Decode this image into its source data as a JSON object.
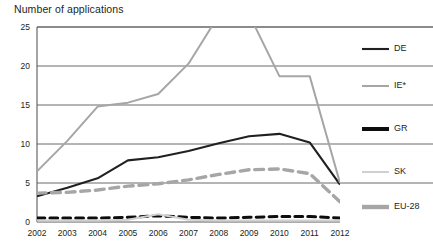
{
  "chart_data": {
    "type": "line",
    "title": "Number of applications",
    "xlabel": "",
    "ylabel": "",
    "categories": [
      "2002",
      "2003",
      "2004",
      "2005",
      "2006",
      "2007",
      "2008",
      "2009",
      "2010",
      "2011",
      "2012"
    ],
    "ylim": [
      0,
      25
    ],
    "xlim": [
      "2002",
      "2012"
    ],
    "yticks": [
      "0",
      "5",
      "10",
      "15",
      "20",
      "25"
    ],
    "ytick_values": [
      0,
      5,
      10,
      15,
      20,
      25
    ],
    "grid": "horizontal",
    "legend_position": "right",
    "note": "IE* series exceeds the 25 axis maximum between 2007 and 2009 and is clipped at the plot top",
    "series": [
      {
        "name": "DE",
        "color": "#231f20",
        "style": "solid",
        "width": 2.1,
        "values": [
          3.3,
          4.4,
          5.6,
          7.9,
          8.3,
          9.1,
          10.1,
          11.0,
          11.3,
          10.2,
          4.8
        ]
      },
      {
        "name": "IE*",
        "color": "#a6a6a6",
        "style": "solid",
        "width": 2.0,
        "values": [
          6.5,
          10.4,
          14.8,
          15.3,
          16.4,
          20.3,
          26.5,
          26.6,
          18.7,
          18.7,
          5.0
        ]
      },
      {
        "name": "GR",
        "color": "#0d0d0d",
        "style": "dashed",
        "width": 3.0,
        "values": [
          0.5,
          0.5,
          0.5,
          0.6,
          0.8,
          0.6,
          0.5,
          0.6,
          0.7,
          0.7,
          0.5
        ]
      },
      {
        "name": "SK",
        "color": "#d0d0d0",
        "style": "solid",
        "width": 2.0,
        "values": [
          0.2,
          0.2,
          0.2,
          0.3,
          1.0,
          0.3,
          0.2,
          0.2,
          0.2,
          0.2,
          0.2
        ]
      },
      {
        "name": "EU-28",
        "color": "#a6a6a6",
        "style": "dashed",
        "width": 3.4,
        "values": [
          3.7,
          3.8,
          4.1,
          4.6,
          4.9,
          5.4,
          6.1,
          6.7,
          6.8,
          6.2,
          2.6
        ]
      }
    ]
  },
  "legend": {
    "items": [
      {
        "label": "DE"
      },
      {
        "label": "IE*"
      },
      {
        "label": "GR"
      },
      {
        "label": "SK"
      },
      {
        "label": "EU-28"
      }
    ]
  },
  "colors": {
    "axis": "#595959",
    "grid": "#595959",
    "text": "#231f20",
    "de": "#231f20",
    "ie": "#a6a6a6",
    "gr": "#0d0d0d",
    "sk": "#d0d0d0",
    "eu28": "#a6a6a6"
  }
}
